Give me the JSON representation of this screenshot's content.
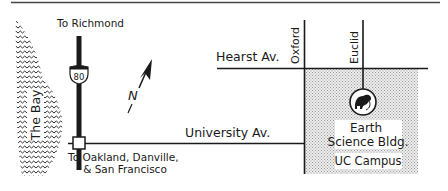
{
  "map": {
    "title": "Directions to Earth Science Building",
    "colors": {
      "ink": "#1a1a1a",
      "background": "#ffffff",
      "campus_fill": "#d9d9d9",
      "top_rule": "#444444"
    },
    "labels": {
      "to_richmond": "To Richmond",
      "to_oakland_line1": "To Oakland, Danville,",
      "to_oakland_line2": "& San Francisco",
      "the_bay": "The Bay",
      "highway_number": "80",
      "hearst": "Hearst Av.",
      "university": "University Av.",
      "oxford": "Oxford",
      "euclid": "Euclid",
      "building_line1": "Earth",
      "building_line2": "Science Bldg.",
      "campus": "UC Campus",
      "north": "N"
    },
    "icons": {
      "building_marker": "dinosaur-icon",
      "north_arrow": "north-arrow-icon",
      "highway_shield": "interstate-shield-icon",
      "interchange": "interchange-square-icon"
    }
  }
}
